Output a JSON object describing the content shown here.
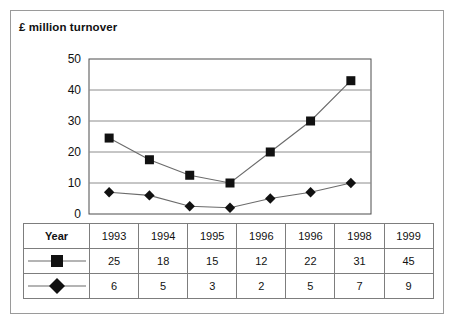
{
  "chart_data": {
    "type": "line",
    "title": "£ million turnover",
    "xlabel": "",
    "ylabel": "",
    "ylim": [
      0,
      50
    ],
    "yticks": [
      0,
      10,
      20,
      30,
      40,
      50
    ],
    "grid": true,
    "legend_position": "table-row-markers",
    "categories": [
      "1993",
      "1994",
      "1995",
      "1996",
      "1996",
      "1998",
      "1999"
    ],
    "series": [
      {
        "name": "square-series",
        "marker": "square",
        "table_values": [
          25,
          18,
          15,
          12,
          22,
          31,
          45
        ],
        "plotted_values": [
          24.5,
          17.5,
          12.5,
          10,
          20,
          30,
          43
        ]
      },
      {
        "name": "diamond-series",
        "marker": "diamond",
        "table_values": [
          6,
          5,
          3,
          2,
          5,
          7,
          9
        ],
        "plotted_values": [
          7,
          6,
          2.5,
          2,
          5,
          7,
          10
        ]
      }
    ]
  },
  "chart": {
    "title": "£ million turnover",
    "y_axis": {
      "ticks": [
        "50",
        "40",
        "30",
        "20",
        "10",
        "0"
      ]
    }
  },
  "table": {
    "header_label": "Year",
    "years": [
      "1993",
      "1994",
      "1995",
      "1996",
      "1996",
      "1998",
      "1999"
    ],
    "rows": [
      {
        "marker_name": "square-marker",
        "values": [
          "25",
          "18",
          "15",
          "12",
          "22",
          "31",
          "45"
        ]
      },
      {
        "marker_name": "diamond-marker",
        "values": [
          "6",
          "5",
          "3",
          "2",
          "5",
          "7",
          "9"
        ]
      }
    ]
  },
  "colors": {
    "ink": "#111111",
    "grid": "#8c8c8c",
    "axis": "#4d4d4d",
    "marker": "#111111",
    "line": "#6b6b6b",
    "border": "#9a9a9a",
    "table_border": "#7d7d7d",
    "background": "#ffffff"
  }
}
